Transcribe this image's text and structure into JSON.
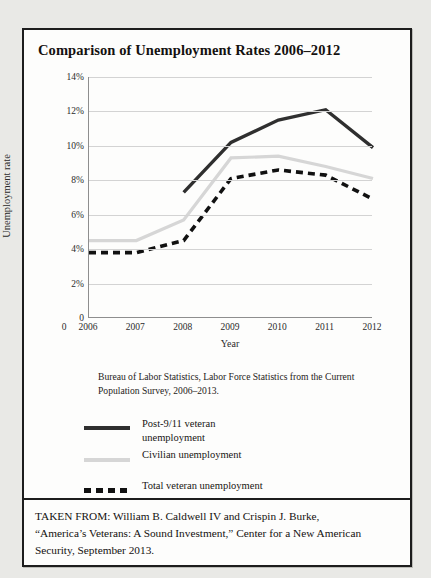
{
  "figure": {
    "title": "Comparison of Unemployment Rates 2006–2012",
    "source_note": "Bureau of Labor Statistics, Labor Force Statistics from the Current Population Survey, 2006–2013.",
    "footer_lines": [
      "TAKEN FROM: William B. Caldwell IV and Crispin J. Burke,",
      "“America’s Veterans: A Sound Investment,” Center for a New American",
      "Security, September 2013."
    ]
  },
  "colors": {
    "post911": "#2f2f2f",
    "civilian": "#d6d6d6",
    "total_veteran": "#111111",
    "gridline": "#d3d3d3",
    "axis": "#8e8e8e",
    "frame": "#1d1d1d",
    "page_background": "#e9e9e6",
    "panel_background": "#fdfdfc"
  },
  "legend": {
    "position": "below-plot",
    "items": [
      {
        "label": "Post-9/11 veteran\nunemployment",
        "label_line1": "Post-9/11 veteran",
        "label_line2": "unemployment",
        "style": "solid-thick-dark",
        "swatch": "line-swatch-dark"
      },
      {
        "label": "Civilian unemployment",
        "label_line1": "Civilian unemployment",
        "label_line2": "",
        "style": "solid-light-gray",
        "swatch": "line-swatch-gray"
      },
      {
        "label": "Total veteran unemployment",
        "label_line1": "Total veteran unemployment",
        "label_line2": "",
        "style": "dashed-black",
        "swatch": "line-swatch-dashed"
      }
    ]
  },
  "chart_data": {
    "type": "line",
    "title": "Comparison of Unemployment Rates 2006–2012",
    "xlabel": "Year",
    "ylabel": "Unemployment rate",
    "categories": [
      "2006",
      "2007",
      "2008",
      "2009",
      "2010",
      "2011",
      "2012"
    ],
    "x": [
      2006,
      2007,
      2008,
      2009,
      2010,
      2011,
      2012
    ],
    "xlim": [
      2006,
      2012
    ],
    "ylim": [
      0,
      14
    ],
    "ytick_labels": [
      "0",
      "2%",
      "4%",
      "6%",
      "8%",
      "10%",
      "12%",
      "14%"
    ],
    "ytick_values": [
      0,
      2,
      4,
      6,
      8,
      10,
      12,
      14
    ],
    "xtick_labels": [
      "0",
      "2006",
      "2007",
      "2008",
      "2009",
      "2010",
      "2011",
      "2012"
    ],
    "grid": true,
    "grid_axis": "y",
    "units": "percent",
    "series": [
      {
        "name": "Post-9/11 veteran unemployment",
        "color": "#2f2f2f",
        "style": "solid",
        "width": 3.4,
        "x": [
          2008,
          2009,
          2010,
          2011,
          2012
        ],
        "values": [
          7.3,
          10.2,
          11.5,
          12.1,
          9.9
        ]
      },
      {
        "name": "Civilian unemployment",
        "color": "#d6d6d6",
        "style": "solid",
        "width": 3.2,
        "x": [
          2006,
          2007,
          2008,
          2009,
          2010,
          2011,
          2012
        ],
        "values": [
          4.5,
          4.5,
          5.7,
          9.3,
          9.4,
          8.8,
          8.1
        ]
      },
      {
        "name": "Total veteran unemployment",
        "color": "#111111",
        "style": "dashed",
        "width": 3.6,
        "x": [
          2006,
          2007,
          2008,
          2009,
          2010,
          2011,
          2012
        ],
        "values": [
          3.8,
          3.8,
          4.5,
          8.1,
          8.6,
          8.3,
          6.9
        ]
      }
    ]
  }
}
